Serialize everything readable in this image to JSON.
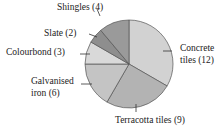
{
  "chart_data": {
    "type": "pie",
    "title": "",
    "start_angle_deg": 0,
    "direction": "clockwise",
    "slices": [
      {
        "label": "Concrete tiles",
        "value": 12,
        "color": "#d2d2d2"
      },
      {
        "label": "Terracotta tiles",
        "value": 9,
        "color": "#b3b3b3"
      },
      {
        "label": "Galvanised iron",
        "value": 6,
        "color": "#c4c4c4"
      },
      {
        "label": "Colourbond",
        "value": 3,
        "color": "#d9d9d9"
      },
      {
        "label": "Slate",
        "value": 2,
        "color": "#8e8e8e"
      },
      {
        "label": "Shingles",
        "value": 4,
        "color": "#9a9a9a"
      }
    ]
  },
  "labels": {
    "shingles": "Shingles (4)",
    "slate": "Slate (2)",
    "colourbond": "Colourbond (3)",
    "galvanised_1": "Galvanised",
    "galvanised_2": "iron (6)",
    "concrete_1": "Concrete",
    "concrete_2": "tiles (12)",
    "terracotta": "Terracotta tiles (9)"
  }
}
